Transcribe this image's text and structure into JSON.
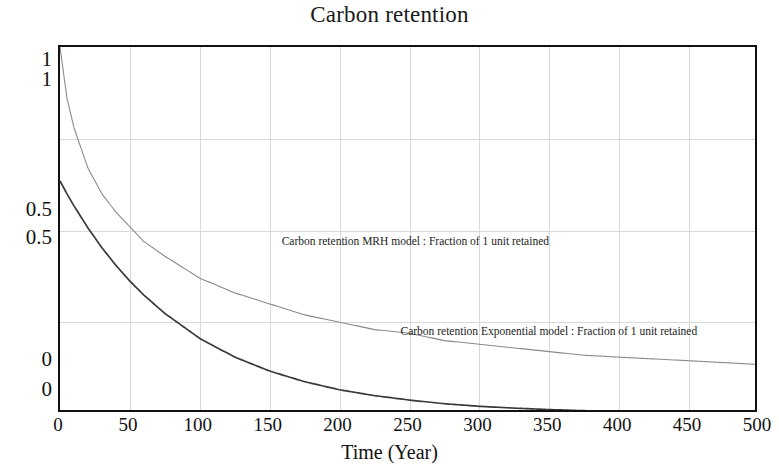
{
  "chart_data": {
    "type": "line",
    "title": "Carbon retention",
    "xlabel": "Time (Year)",
    "ylabel": "",
    "xlim": [
      0,
      500
    ],
    "ylim": [
      0,
      1
    ],
    "grid": true,
    "legend_position": "in-plot annotations",
    "x_ticks": [
      "0",
      "50",
      "100",
      "150",
      "200",
      "250",
      "300",
      "350",
      "400",
      "450",
      "500"
    ],
    "x_tick_values": [
      0,
      50,
      100,
      150,
      200,
      250,
      300,
      350,
      400,
      450,
      500
    ],
    "y_axis_scales": [
      {
        "name": "scale-1",
        "ticks": [
          "1",
          "0.5",
          "0"
        ],
        "values": [
          1,
          0.5,
          0
        ]
      },
      {
        "name": "scale-2",
        "ticks": [
          "1",
          "0.5",
          "0"
        ],
        "values": [
          1,
          0.5,
          0
        ]
      }
    ],
    "y_tick_rows": [
      {
        "upper": "1",
        "lower": "1"
      },
      {
        "upper": "0.5",
        "lower": "0.5"
      },
      {
        "upper": "0",
        "lower": "0"
      }
    ],
    "series": [
      {
        "name": "Carbon retention MRH model : Fraction of 1 unit retained",
        "color": "#8a8a8a",
        "x": [
          0,
          5,
          10,
          20,
          30,
          40,
          50,
          60,
          75,
          100,
          125,
          150,
          175,
          200,
          225,
          250,
          275,
          300,
          325,
          350,
          375,
          400,
          425,
          450,
          475,
          500
        ],
        "values": [
          1.0,
          0.86,
          0.78,
          0.67,
          0.6,
          0.55,
          0.51,
          0.47,
          0.43,
          0.37,
          0.33,
          0.3,
          0.27,
          0.25,
          0.23,
          0.22,
          0.2,
          0.19,
          0.18,
          0.17,
          0.16,
          0.155,
          0.15,
          0.145,
          0.14,
          0.135
        ]
      },
      {
        "name": "Carbon retention Exponential model : Fraction of 1 unit retained",
        "color": "#3a3a3a",
        "x": [
          0,
          5,
          10,
          20,
          30,
          40,
          50,
          60,
          75,
          100,
          125,
          150,
          175,
          200,
          225,
          250,
          275,
          300,
          325,
          350,
          375,
          400,
          425,
          450,
          475,
          500
        ],
        "values": [
          0.635,
          0.6,
          0.567,
          0.507,
          0.453,
          0.405,
          0.362,
          0.324,
          0.274,
          0.206,
          0.155,
          0.117,
          0.088,
          0.066,
          0.05,
          0.038,
          0.028,
          0.021,
          0.016,
          0.012,
          0.009,
          0.007,
          0.005,
          0.004,
          0.003,
          0.002
        ]
      }
    ],
    "annotations": [
      {
        "text": "Carbon retention MRH model : Fraction of 1 unit retained",
        "x": 160,
        "y": 0.46
      },
      {
        "text": "Carbon retention Exponential model : Fraction of 1 unit retained",
        "x": 245,
        "y": 0.215
      }
    ]
  }
}
